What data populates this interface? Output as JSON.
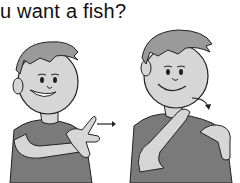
{
  "caption": {
    "text": "u want a fish?"
  },
  "figures": [
    {
      "label": "boy-signing-pose-1",
      "description": "boy smiling, fingers crossed, arrow pointing right"
    },
    {
      "label": "boy-signing-pose-2",
      "description": "boy with hand at chin, arrow curving down"
    }
  ],
  "colors": {
    "skin": "#d6d6d6",
    "hair": "#9a9a9a",
    "shirt": "#7a7a7a",
    "outline": "#222222",
    "background": "#ffffff"
  }
}
